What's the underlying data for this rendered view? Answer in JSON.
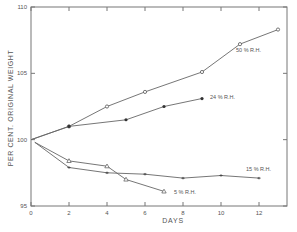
{
  "chart_data": {
    "type": "line",
    "title": "",
    "xlabel": "DAYS",
    "ylabel": "PER CENT. ORIGINAL WEIGHT",
    "xlim": [
      0,
      13.5
    ],
    "ylim": [
      95,
      110
    ],
    "x_ticks": [
      0,
      2,
      4,
      6,
      8,
      10,
      12
    ],
    "x_tick_labels": [
      "0",
      "2",
      "4",
      "6",
      "8",
      "10",
      "12"
    ],
    "y_ticks": [
      95,
      100,
      105,
      110
    ],
    "y_tick_labels": [
      "95",
      "100",
      "105",
      "110"
    ],
    "grid": false,
    "legend": "inline labels at line ends",
    "series": [
      {
        "name": "50 % R.H.",
        "marker": "open-circle",
        "x": [
          0,
          2,
          4,
          6,
          9,
          11,
          13
        ],
        "y": [
          100.0,
          101.0,
          102.5,
          103.6,
          105.1,
          107.2,
          108.3
        ],
        "label_pos": [
          236,
          52
        ]
      },
      {
        "name": "24 % R.H.",
        "marker": "filled-circle",
        "x": [
          0,
          2,
          5,
          7,
          9
        ],
        "y": [
          100.0,
          101.0,
          101.5,
          102.5,
          103.1
        ],
        "label_pos": [
          210,
          99
        ]
      },
      {
        "name": "15 % R.H.",
        "marker": "cross",
        "x": [
          0.2,
          2,
          4,
          6,
          8,
          10,
          12
        ],
        "y": [
          99.8,
          97.9,
          97.5,
          97.4,
          97.1,
          97.3,
          97.1
        ],
        "label_pos": [
          246,
          171
        ]
      },
      {
        "name": "5 % R.H.",
        "marker": "open-triangle",
        "x": [
          0.2,
          2,
          4,
          5,
          7
        ],
        "y": [
          99.8,
          98.4,
          98.0,
          97.0,
          96.1
        ],
        "label_pos": [
          174,
          194
        ]
      }
    ]
  }
}
